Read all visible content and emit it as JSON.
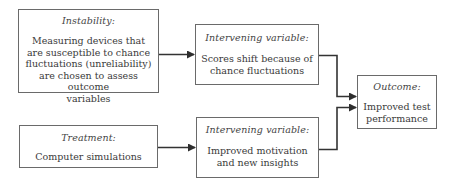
{
  "diagram": {
    "type": "causal-flow",
    "boxes": {
      "instability": {
        "title": "Instability:",
        "lines": [
          "Measuring devices that",
          "are susceptible to chance",
          "fluctuations (unreliability)",
          "are chosen to assess outcome",
          "variables"
        ]
      },
      "intervening1": {
        "title": "Intervening variable:",
        "lines": [
          "Scores shift because of",
          "chance fluctuations"
        ]
      },
      "treatment": {
        "title": "Treatment:",
        "lines": [
          "Computer simulations"
        ]
      },
      "intervening2": {
        "title": "Intervening variable:",
        "lines": [
          "Improved motivation",
          "and new insights"
        ]
      },
      "outcome": {
        "title": "Outcome:",
        "lines": [
          "Improved test",
          "performance"
        ]
      }
    },
    "edges": [
      {
        "from": "instability",
        "to": "intervening1"
      },
      {
        "from": "treatment",
        "to": "intervening2"
      },
      {
        "from": "intervening1",
        "to": "outcome"
      },
      {
        "from": "intervening2",
        "to": "outcome"
      }
    ],
    "colors": {
      "line": "#333333",
      "border": "#6a6a6a",
      "text": "#3a3a3a"
    }
  }
}
